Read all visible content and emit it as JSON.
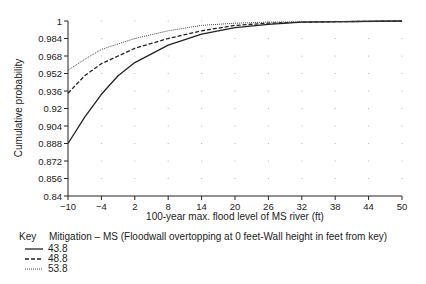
{
  "chart_data": {
    "type": "line",
    "title": "",
    "xlabel": "100-year max. flood level of MS river (ft)",
    "ylabel": "Cumulative probability",
    "xlim": [
      -10,
      50
    ],
    "ylim": [
      0.84,
      1
    ],
    "x_ticks": [
      "-10",
      "-4",
      "2",
      "8",
      "14",
      "20",
      "26",
      "32",
      "38",
      "44",
      "50"
    ],
    "y_ticks": [
      "1",
      "0.984",
      "0.968",
      "0.952",
      "0.936",
      "0.92",
      "0.904",
      "0.888",
      "0.872",
      "0.856",
      "0.84"
    ],
    "grid": "dotted points",
    "legend_position": "below",
    "legend": {
      "key_label": "Key",
      "title": "Mitigation – MS (Floodwall overtopping at 0 feet-Wall height in feet from key)",
      "entries": [
        {
          "label": "43.8",
          "style": "solid"
        },
        {
          "label": "48.8",
          "style": "dashed"
        },
        {
          "label": "53.8",
          "style": "dotted"
        }
      ]
    },
    "series": [
      {
        "name": "43.8",
        "style": "solid",
        "x": [
          -10,
          -7,
          -4,
          -1,
          2,
          5,
          8,
          14,
          20,
          26,
          32,
          50
        ],
        "values": [
          0.888,
          0.912,
          0.933,
          0.95,
          0.962,
          0.97,
          0.978,
          0.988,
          0.994,
          0.997,
          0.999,
          1.0
        ]
      },
      {
        "name": "48.8",
        "style": "dashed",
        "x": [
          -10,
          -7,
          -4,
          -1,
          2,
          8,
          14,
          20,
          26,
          32,
          50
        ],
        "values": [
          0.934,
          0.95,
          0.961,
          0.968,
          0.975,
          0.984,
          0.991,
          0.996,
          0.998,
          0.999,
          1.0
        ]
      },
      {
        "name": "53.8",
        "style": "dotted",
        "x": [
          -10,
          -7,
          -4,
          -1,
          2,
          8,
          14,
          20,
          26,
          50
        ],
        "values": [
          0.955,
          0.965,
          0.974,
          0.979,
          0.984,
          0.991,
          0.996,
          0.998,
          0.999,
          1.0
        ]
      }
    ]
  }
}
